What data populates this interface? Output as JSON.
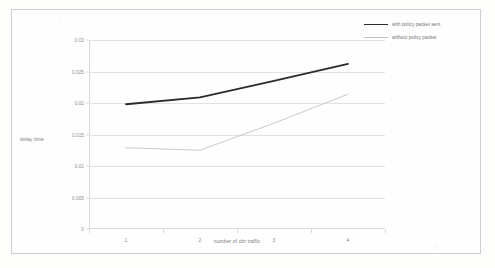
{
  "chart_data": {
    "type": "line",
    "title": "",
    "xlabel": "number of cbr traffic",
    "ylabel": "delay time",
    "categories": [
      "1",
      "2",
      "3",
      "4"
    ],
    "yticks": [
      "0.03",
      "0.025",
      "0.02",
      "0.015",
      "0.01",
      "0.005",
      "0"
    ],
    "ytick_values": [
      0.03,
      0.025,
      0.02,
      0.015,
      0.01,
      0.005,
      0
    ],
    "ylim": [
      0,
      0.03
    ],
    "grid": "horizontal",
    "legend_position": "top-right",
    "series": [
      {
        "name": "with policy packet sent",
        "values": [
          0.0198,
          0.0209,
          0.0235,
          0.0262
        ],
        "color": "#2b2b2b",
        "width": 1.8
      },
      {
        "name": "without policy packet",
        "values": [
          0.0129,
          0.0125,
          0.0168,
          0.0214
        ],
        "color": "#c2c2c2",
        "width": 0.9
      }
    ]
  },
  "legend": {
    "items": [
      {
        "label": "with policy packet sent"
      },
      {
        "label": "without policy packet"
      }
    ]
  },
  "colors": {
    "page_background": "#fdfdfc",
    "frame_border": "#cfcfcf",
    "gridline": "#e2e2e2",
    "tick_text": "#8d8d8d",
    "axis_title_text": "#7b7b7b",
    "series_primary": "#2b2b2b",
    "series_secondary": "#c2c2c2"
  }
}
